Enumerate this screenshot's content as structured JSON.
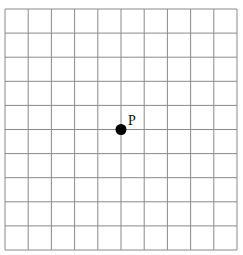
{
  "diagram": {
    "type": "grid-with-point",
    "grid": {
      "columns": 10,
      "rows": 10,
      "left": 5,
      "top": 9,
      "right": 237,
      "bottom": 250,
      "line_color": "#8a8a8a",
      "line_width": 1
    },
    "point": {
      "label": "P",
      "grid_col": 5,
      "grid_row": 5,
      "radius": 5.5,
      "color": "#000000",
      "label_dx": 7,
      "label_dy": -5
    }
  }
}
